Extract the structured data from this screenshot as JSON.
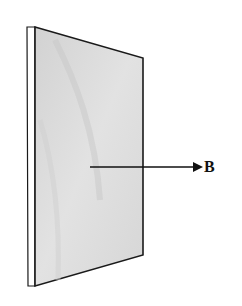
{
  "diagram": {
    "title": "",
    "plate": {
      "face_color": "#d9d9d9",
      "edge_color": "#ffffff",
      "outline_color": "#1a1a1a"
    },
    "vector": {
      "label": "B",
      "direction": "right (normal to plate)",
      "color": "#111111"
    }
  }
}
